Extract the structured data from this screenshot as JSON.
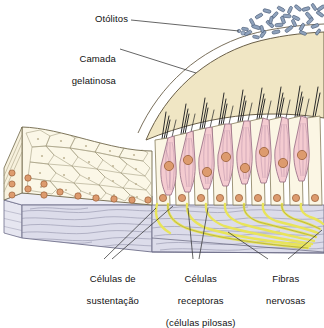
{
  "figure": {
    "language": "pt-BR",
    "background_color": "#ffffff"
  },
  "labels": {
    "otoliths": "Otólitos",
    "gelatinous_layer_line1": "Camada",
    "gelatinous_layer_line2": "gelatinosa",
    "supporting_cells_line1": "Células de",
    "supporting_cells_line2": "sustentação",
    "receptor_cells_line1": "Células",
    "receptor_cells_line2": "receptoras",
    "receptor_cells_line3": "(células pilosas)",
    "nerve_fibers_line1": "Fibras",
    "nerve_fibers_line2": "nervosas"
  },
  "colors": {
    "otolith_fill": "#8fa2bc",
    "otolith_stroke": "#3c4f6b",
    "gelatinous_fill": "#f0e6c4",
    "gelatinous_stroke": "#6b6049",
    "hair_cell_fill": "#f4cbd0",
    "hair_cell_stroke": "#9a6f86",
    "support_cell_fill": "#fbf6e4",
    "support_cell_stroke": "#8c8363",
    "nucleus_fill": "#dd9b6e",
    "nucleus_stroke": "#9a5f38",
    "connective_fill": "#dcdcea",
    "connective_stroke": "#7f7f96",
    "nerve_fill": "#e8e45a",
    "nerve_stroke": "#8f8a2c",
    "stereocilia": "#2b2b2b",
    "leader_line": "#333333",
    "label_text": "#111111"
  },
  "structures": [
    {
      "name": "otoliths",
      "description": "cluster of blue-grey calcium carbonate crystals resting on top of the gelatinous layer"
    },
    {
      "name": "gelatinous-layer",
      "description": "pale cream otolithic membrane dome covering the hair bundles"
    },
    {
      "name": "hair-cells",
      "description": "pink receptor cells with purple striations and orange nuclei bearing dark stereocilia"
    },
    {
      "name": "supporting-cells",
      "description": "cream coloured columnar cells between hair cells with basal orange nuclei"
    },
    {
      "name": "epithelium-surface",
      "description": "cobblestone polygonal cell surface view on the left cut-away"
    },
    {
      "name": "connective-tissue",
      "description": "lavender-grey fibrous basement layer shown as a 3D slab"
    },
    {
      "name": "nerve-fibers",
      "description": "yellow afferent fibres branching from cell bases and converging into a bundle at lower right"
    }
  ]
}
